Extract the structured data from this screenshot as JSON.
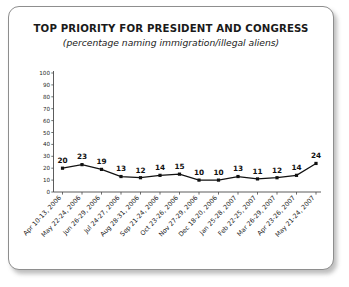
{
  "chart_data": {
    "type": "line",
    "title": "TOP PRIORITY FOR PRESIDENT AND CONGRESS",
    "subtitle": "(percentage naming immigration/illegal aliens)",
    "xlabel": "",
    "ylabel": "",
    "ylim": [
      0,
      100
    ],
    "ytick_labels": [
      "100",
      "90",
      "80",
      "70",
      "60",
      "50",
      "40",
      "30",
      "20",
      "10",
      "0"
    ],
    "yticks": [
      100,
      90,
      80,
      70,
      60,
      50,
      40,
      30,
      20,
      10,
      0
    ],
    "grid": false,
    "legend": false,
    "marker": "square",
    "line_color": "#111111",
    "categories": [
      "Apr 10-13, 2006",
      "May 22-24, 2006",
      "Jun 26-29, 2006",
      "Jul 24-27, 2006",
      "Aug 28-31, 2006",
      "Sep 21-24, 2006",
      "Oct 23-26, 2006",
      "Nov 27-29, 2006",
      "Dec 18-20, 2006",
      "Jan 25-28, 2007",
      "Feb 22-25, 2007",
      "Mar 26-29, 2007",
      "Apr 23-26, 2007",
      "May 21-24, 2007"
    ],
    "values": [
      20,
      23,
      19,
      13,
      12,
      14,
      15,
      10,
      10,
      13,
      11,
      12,
      14,
      24
    ],
    "data_labels": [
      "20",
      "23",
      "19",
      "13",
      "12",
      "14",
      "15",
      "10",
      "10",
      "13",
      "11",
      "12",
      "14",
      "24"
    ]
  }
}
